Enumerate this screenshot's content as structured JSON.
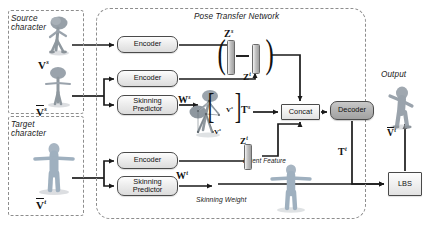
{
  "diagram": {
    "title": "Pose Transfer Network",
    "groups": {
      "source": "Source\ncharacter",
      "target": "Target\ncharacter",
      "network": "Pose Transfer Network",
      "output": "Output"
    },
    "nodes": {
      "encoder_1": "Encoder",
      "encoder_2": "Encoder",
      "encoder_3": "Encoder",
      "skinning_predictor_1": "Skinning\nPredictor",
      "skinning_predictor_2": "Skinning\nPredictor",
      "concat": "Concat",
      "decoder": "Decoder",
      "lbs": "LBS"
    },
    "annotations": {
      "latent_feature": "Latent Feature",
      "skinning_weight": "Skinning Weight"
    },
    "symbols": {
      "v_source": "V",
      "v_source_sup": "s",
      "v_bar_source": "V",
      "v_bar_source_sup": "s",
      "v_bar_target": "V",
      "v_bar_target_sup": "t",
      "z_source": "Z",
      "z_source_sup": "s",
      "z_target": "Z",
      "z_target_sup": "t",
      "z_target_latent": "Z",
      "z_target_latent_sup": "t",
      "w_source": "W",
      "w_source_sup": "s",
      "w_target": "W",
      "w_target_sup": "t",
      "t_source": "T",
      "t_source_sup": "s",
      "t_target": "T",
      "t_target_sup": "t",
      "v_hat_target": "V",
      "v_hat_target_sup": "t",
      "v_inner_1": "V",
      "v_inner_1_sup": "s",
      "v_inner_2": "V",
      "v_inner_2_sup": "s",
      "minus": "−",
      "paren_open": "(",
      "paren_close": ")",
      "bracket_open": "[",
      "bracket_close": "]"
    },
    "colors": {
      "node_border": "#4a4a4a",
      "decoder_fill": "#b3b3b3",
      "dashed_border": "#8d8d8d",
      "arrow": "#1a1a1a",
      "figure_body": "#9aa3ac",
      "figure_target": "#9fb0bf"
    }
  }
}
